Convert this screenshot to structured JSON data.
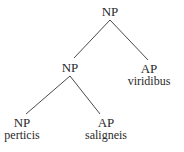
{
  "tree": {
    "root": {
      "label": "NP",
      "children": [
        {
          "label": "NP",
          "children": [
            {
              "label": "NP",
              "word": "perticis"
            },
            {
              "label": "AP",
              "word": "saligneis"
            }
          ]
        },
        {
          "label": "AP",
          "word": "viridibus"
        }
      ]
    }
  },
  "nodes": {
    "root": {
      "label": "NP"
    },
    "inner_np": {
      "label": "NP"
    },
    "ap_right": {
      "label": "AP",
      "word": "viridibus"
    },
    "np_leaf": {
      "label": "NP",
      "word": "perticis"
    },
    "ap_leaf": {
      "label": "AP",
      "word": "saligneis"
    }
  },
  "colors": {
    "line": "#4a4a4a",
    "text": "#2a2a2a",
    "background": "#ffffff"
  }
}
